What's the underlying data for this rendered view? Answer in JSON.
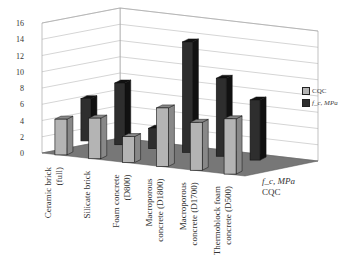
{
  "chart_data": {
    "type": "bar",
    "style": "3d-clustered-depth",
    "title": "",
    "categories": [
      "Ceramic brick (full)",
      "Silicate brick",
      "Foam concrete (D800)",
      "Macroporous concrete (D1800)",
      "Macroporous concrete (D1700)",
      "Thermoblock foam concrete (D500)"
    ],
    "series": [
      {
        "name": "CQC",
        "values": [
          4.4,
          5.0,
          3.2,
          7.2,
          5.9,
          6.8
        ],
        "color": "#b4b4b4"
      },
      {
        "name": "f_c, MPa",
        "values": [
          5.2,
          7.6,
          2.5,
          13.6,
          9.6,
          7.4
        ],
        "color": "#2e2e2e"
      }
    ],
    "depth_axis_labels": [
      "f_c, MPa",
      "CQC"
    ],
    "yticks": [
      0,
      2,
      4,
      6,
      8,
      10,
      12,
      14,
      16
    ],
    "ylim": [
      0,
      16
    ],
    "grid": true,
    "legend_position": "right"
  },
  "legend": {
    "items": [
      "CQC",
      "f_c, MPa"
    ]
  },
  "depth_labels": {
    "back": "f_c, MPa",
    "front": "CQC"
  }
}
